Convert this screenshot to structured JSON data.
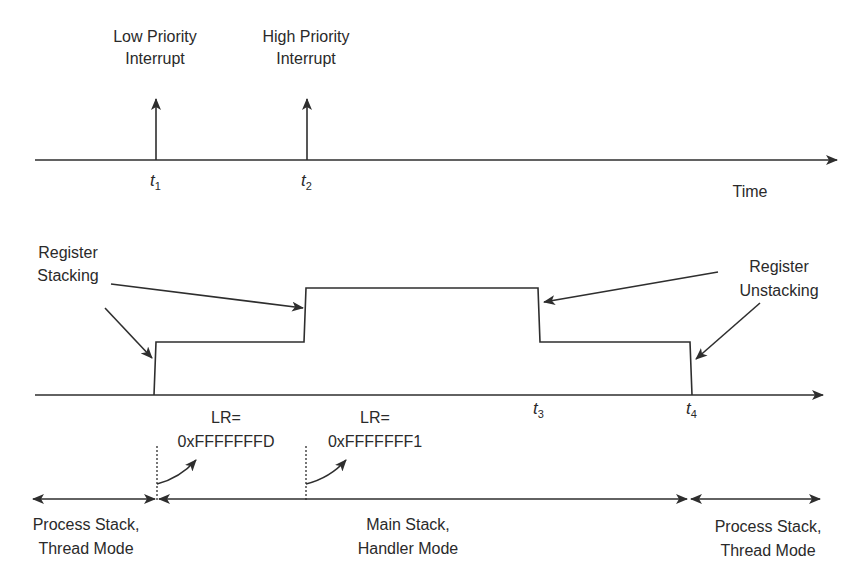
{
  "diagram": {
    "colors": {
      "line": "#2e2e2e",
      "text": "#2a2a2a",
      "background": "#ffffff"
    },
    "timeline_top": {
      "axis_label": "Time",
      "events": [
        {
          "label_line1": "Low Priority",
          "label_line2": "Interrupt",
          "tick": "t",
          "tick_sub": "1"
        },
        {
          "label_line1": "High Priority",
          "label_line2": "Interrupt",
          "tick": "t",
          "tick_sub": "2"
        }
      ]
    },
    "stack_graph": {
      "annotations": {
        "stacking": {
          "line1": "Register",
          "line2": "Stacking"
        },
        "unstacking": {
          "line1": "Register",
          "line2": "Unstacking"
        }
      },
      "ticks": [
        {
          "tick": "t",
          "tick_sub": "3"
        },
        {
          "tick": "t",
          "tick_sub": "4"
        }
      ],
      "lr_values": [
        {
          "line1": "LR=",
          "line2": "0xFFFFFFFD"
        },
        {
          "line1": "LR=",
          "line2": "0xFFFFFFF1"
        }
      ]
    },
    "modes": [
      {
        "line1": "Process Stack,",
        "line2": "Thread Mode"
      },
      {
        "line1": "Main Stack,",
        "line2": "Handler Mode"
      },
      {
        "line1": "Process Stack,",
        "line2": "Thread Mode"
      }
    ]
  }
}
